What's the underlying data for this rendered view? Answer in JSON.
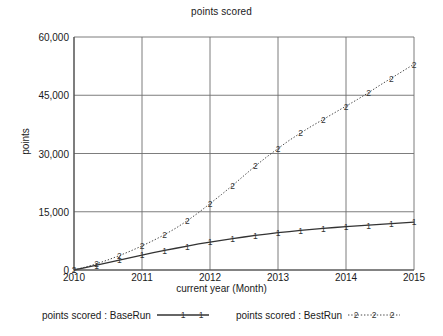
{
  "chart_data": {
    "type": "line",
    "title": "points scored",
    "xlabel": "current year (Month)",
    "ylabel": "points",
    "xlim": [
      2010,
      2015
    ],
    "ylim": [
      0,
      60000
    ],
    "grid": true,
    "legend_position": "bottom",
    "x_ticks": [
      "2010",
      "2011",
      "2012",
      "2013",
      "2014",
      "2015"
    ],
    "x_tick_values": [
      2010,
      2011,
      2012,
      2013,
      2014,
      2015
    ],
    "y_ticks": [
      "0",
      "15,000",
      "30,000",
      "45,000",
      "60,000"
    ],
    "y_tick_values": [
      0,
      15000,
      30000,
      45000,
      60000
    ],
    "x": [
      2010,
      2010.1667,
      2010.3333,
      2010.5,
      2010.6667,
      2010.8333,
      2011,
      2011.1667,
      2011.3333,
      2011.5,
      2011.6667,
      2011.8333,
      2012,
      2012.1667,
      2012.3333,
      2012.5,
      2012.6667,
      2012.8333,
      2013,
      2013.1667,
      2013.3333,
      2013.5,
      2013.6667,
      2013.8333,
      2014,
      2014.1667,
      2014.3333,
      2014.5,
      2014.6667,
      2014.8333,
      2015
    ],
    "series": [
      {
        "name": "points scored : BaseRun",
        "marker": "1",
        "linestyle": "solid",
        "color": "#333333",
        "values": [
          0,
          600,
          1250,
          1900,
          2550,
          3200,
          3850,
          4450,
          5050,
          5600,
          6150,
          6700,
          7200,
          7650,
          8100,
          8500,
          8900,
          9250,
          9600,
          9900,
          10200,
          10450,
          10700,
          10950,
          11150,
          11350,
          11550,
          11750,
          11950,
          12150,
          12350
        ]
      },
      {
        "name": "points scored : BestRun",
        "marker": "2",
        "linestyle": "dotted",
        "color": "#333333",
        "values": [
          0,
          750,
          1600,
          2600,
          3700,
          4900,
          6200,
          7600,
          9100,
          10800,
          12700,
          14800,
          17100,
          19400,
          21800,
          24300,
          26800,
          29100,
          31300,
          33400,
          35300,
          37100,
          38800,
          40500,
          42200,
          43900,
          45700,
          47600,
          49400,
          51200,
          53000
        ]
      }
    ]
  }
}
